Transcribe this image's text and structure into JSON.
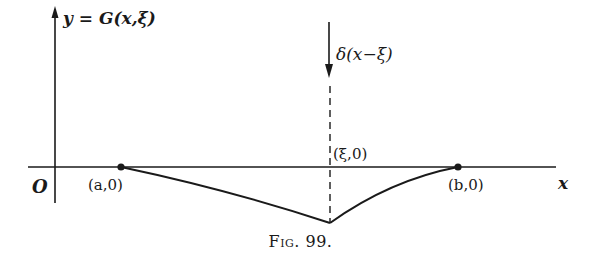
{
  "figure": {
    "caption_prefix": "Fig.",
    "caption_number": "99.",
    "y_axis_label": "y = G(x,ξ)",
    "x_axis_label": "x",
    "origin_label": "O",
    "impulse_label": "δ(x−ξ)",
    "points": [
      {
        "label": "(a,0)"
      },
      {
        "label": "(ξ,0)"
      },
      {
        "label": "(b,0)"
      }
    ],
    "colors": {
      "ink": "#1a1a1a",
      "background": "#ffffff"
    }
  }
}
